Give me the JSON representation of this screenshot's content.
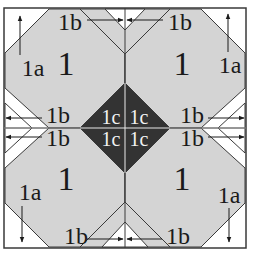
{
  "diagram": {
    "colors": {
      "background": "#ffffff",
      "light_patch": "#d4d4d4",
      "dark_patch": "#333333",
      "line": "#3a3a3a",
      "text": "#1a1a1a",
      "text_on_dark": "#f2f2f2"
    },
    "pieces": {
      "main": "1",
      "corner": "1a",
      "side": "1b",
      "center": "1c"
    },
    "quadrants": [
      {
        "id": "top-left",
        "main_label": "1",
        "corner_label": "1a",
        "side_top_label": "1b",
        "side_inner_label": "1b",
        "center_label": "1c"
      },
      {
        "id": "top-right",
        "main_label": "1",
        "corner_label": "1a",
        "side_top_label": "1b",
        "side_inner_label": "1b",
        "center_label": "1c"
      },
      {
        "id": "bottom-left",
        "main_label": "1",
        "corner_label": "1a",
        "side_top_label": "1b",
        "side_inner_label": "1b",
        "center_label": "1c"
      },
      {
        "id": "bottom-right",
        "main_label": "1",
        "corner_label": "1a",
        "side_top_label": "1b",
        "side_inner_label": "1b",
        "center_label": "1c"
      }
    ]
  }
}
